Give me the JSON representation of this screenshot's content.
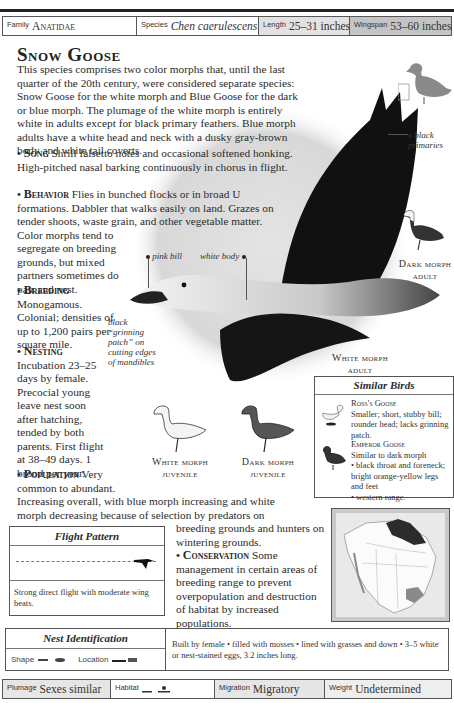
{
  "header": {
    "running_title": "BIRDS OF THE AMERICAS"
  },
  "info_bar_top": {
    "family": {
      "label": "Family",
      "value": "Anatidae"
    },
    "species": {
      "label": "Species",
      "value": "Chen caerulescens"
    },
    "length": {
      "label": "Length",
      "value": "25–31 inches"
    },
    "wingspan": {
      "label": "Wingspan",
      "value": "53–60 inches"
    }
  },
  "title": "Snow Goose",
  "intro": "This species comprises two color morphs that, until the last quarter of the 20th century, were considered separate species: Snow Goose for the white morph and Blue Goose for the dark or blue morph. The plumage of the white morph is entirely white in adults except for black primary feathers. Blue morph adults have a white head and neck with a dusky gray-brown body and white tail coverts.",
  "sections": {
    "song": {
      "heading": "Song",
      "text": "Shrill falsetto notes and occasional softened honking. High-pitched nasal barking continuously in chorus in flight."
    },
    "behavior": {
      "heading": "Behavior",
      "text_wide": "Flies in bunched flocks or in broad U formations. Dabbler that walks easily on land. Grazes on tender shoots, waste grain, and other vegetable matter. Color morphs tend to",
      "text_narrow": "segregate on breeding grounds, but mixed partners sometimes do pair and nest."
    },
    "breeding": {
      "heading": "Breeding",
      "text": "Monogamous. Colonial; densities of up to 1,200 pairs per square mile."
    },
    "nesting": {
      "heading": "Nesting",
      "text": "Incubation 23–25 days by female. Precocial young leave nest soon after hatching, tended by both parents. First flight at 38–49 days. 1 brood per year."
    },
    "population": {
      "heading": "Population",
      "text_narrow": "Very common to abundant.",
      "text_wide": "Increasing overall, with blue morph increasing and white morph decreasing because of selection by predators on",
      "text_right": "breeding grounds and hunters on wintering grounds."
    },
    "conservation": {
      "heading": "Conservation",
      "text": "Some management in certain areas of breeding range to prevent overpopulation and destruction of habitat by increased populations."
    }
  },
  "callouts": {
    "pink_bill": "pink bill",
    "white_body": "white body",
    "black_primaries": "black primaries",
    "grinning_patch": "black “grinning patch” on cutting edges of mandibles"
  },
  "captions": {
    "white_morph_adult": [
      "White morph",
      "adult"
    ],
    "dark_morph_adult": [
      "Dark morph",
      "adult"
    ],
    "white_morph_juvenile": [
      "White morph",
      "juvenile"
    ],
    "dark_morph_juvenile": [
      "Dark morph",
      "juvenile"
    ]
  },
  "similar_birds": {
    "title": "Similar Birds",
    "items": [
      {
        "name": "Ross's Goose",
        "text": "Smaller; short, stubby bill; rounder head; lacks grinning patch."
      },
      {
        "name": "Emperor Goose",
        "text": "Similar to dark morph",
        "bullets": [
          "black throat and foreneck; bright orange-yellow legs and feet",
          "western range."
        ]
      }
    ]
  },
  "flight_pattern": {
    "title": "Flight Pattern",
    "description": "Strong direct flight with moderate wing beats."
  },
  "nest_identification": {
    "title": "Nest Identification",
    "shape_label": "Shape",
    "location_label": "Location",
    "description": "Built by female • filled with mosses • lined with grasses and down • 3–5 white or nest-stained eggs, 3.2 inches long."
  },
  "info_bar_bottom": {
    "plumage": {
      "label": "Plumage",
      "value": "Sexes similar"
    },
    "habitat": {
      "label": "Habitat",
      "value": ""
    },
    "migration": {
      "label": "Migration",
      "value": "Migratory"
    },
    "weight": {
      "label": "Weight",
      "value": "Undetermined"
    }
  },
  "colors": {
    "rule": "#222222",
    "box_border": "#555555",
    "shade1": "#e6e6e6",
    "shade2": "#d2d2d2",
    "shade3": "#bdbdbd",
    "map_range": "#2b2b2b",
    "map_winter": "#8a8a8a"
  }
}
